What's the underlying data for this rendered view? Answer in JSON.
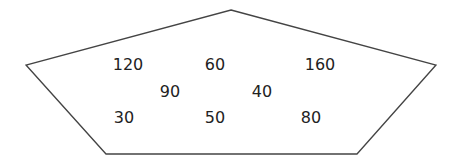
{
  "diagram": {
    "shape": "pentagon",
    "stroke_color": "#444444",
    "fill_color": "#ffffff",
    "vertices": [
      [
        231,
        10
      ],
      [
        436,
        65
      ],
      [
        357,
        154
      ],
      [
        106,
        154
      ],
      [
        26,
        65
      ]
    ],
    "numbers": [
      {
        "value": "120",
        "x": 128,
        "y": 65
      },
      {
        "value": "60",
        "x": 215,
        "y": 65
      },
      {
        "value": "160",
        "x": 320,
        "y": 65
      },
      {
        "value": "90",
        "x": 170,
        "y": 92
      },
      {
        "value": "40",
        "x": 262,
        "y": 92
      },
      {
        "value": "30",
        "x": 124,
        "y": 118
      },
      {
        "value": "50",
        "x": 215,
        "y": 118
      },
      {
        "value": "80",
        "x": 311,
        "y": 118
      }
    ]
  }
}
